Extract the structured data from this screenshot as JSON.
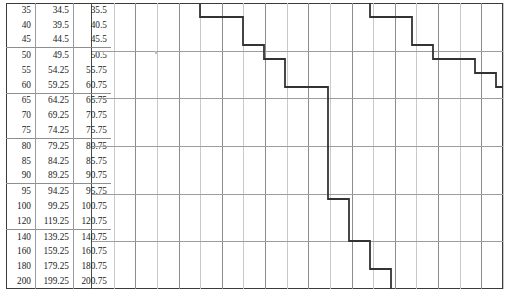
{
  "document": {
    "kind": "printed-table-with-step-chart",
    "page_background": "#ffffff",
    "frame_color": "#3b3b3b",
    "grid_line_color": "#8d8d8d",
    "grid_line_light_color": "#c9c9c9",
    "step_line_color": "#333333"
  },
  "table": {
    "name": "nominal-lower-upper-limits",
    "column_count": 3,
    "row_count": 21,
    "group_size": 3,
    "columns": [
      {
        "key": "nominal",
        "align": "right"
      },
      {
        "key": "lower",
        "align": "right"
      },
      {
        "key": "upper",
        "align": "right"
      }
    ],
    "rows": [
      {
        "nominal": "35",
        "lower": "34.5",
        "upper": "35.5",
        "group_start": true
      },
      {
        "nominal": "40",
        "lower": "39.5",
        "upper": "40.5",
        "group_start": false
      },
      {
        "nominal": "45",
        "lower": "44.5",
        "upper": "45.5",
        "group_start": false
      },
      {
        "nominal": "50",
        "lower": "49.5",
        "upper": "50.5",
        "group_start": true
      },
      {
        "nominal": "55",
        "lower": "54.25",
        "upper": "55.75",
        "group_start": false
      },
      {
        "nominal": "60",
        "lower": "59.25",
        "upper": "60.75",
        "group_start": false
      },
      {
        "nominal": "65",
        "lower": "64.25",
        "upper": "65.75",
        "group_start": true
      },
      {
        "nominal": "70",
        "lower": "69.25",
        "upper": "70.75",
        "group_start": false
      },
      {
        "nominal": "75",
        "lower": "74.25",
        "upper": "75.75",
        "group_start": false
      },
      {
        "nominal": "80",
        "lower": "79.25",
        "upper": "80.75",
        "group_start": true
      },
      {
        "nominal": "85",
        "lower": "84.25",
        "upper": "85.75",
        "group_start": false
      },
      {
        "nominal": "90",
        "lower": "89.25",
        "upper": "90.75",
        "group_start": false
      },
      {
        "nominal": "95",
        "lower": "94.25",
        "upper": "95.75",
        "group_start": true
      },
      {
        "nominal": "100",
        "lower": "99.25",
        "upper": "100.75",
        "group_start": false
      },
      {
        "nominal": "120",
        "lower": "119.25",
        "upper": "120.75",
        "group_start": false
      },
      {
        "nominal": "140",
        "lower": "139.25",
        "upper": "140.75",
        "group_start": true
      },
      {
        "nominal": "160",
        "lower": "159.25",
        "upper": "160.75",
        "group_start": false
      },
      {
        "nominal": "180",
        "lower": "179.25",
        "upper": "180.75",
        "group_start": false
      },
      {
        "nominal": "200",
        "lower": "199.25",
        "upper": "200.75",
        "group_start": false
      }
    ]
  },
  "chart_data": {
    "type": "line",
    "subtype": "step",
    "title": "",
    "xlabel": "",
    "ylabel": "",
    "grid": true,
    "legend": "none",
    "x_gridline_count": 19,
    "y_gridline_count": 7,
    "y_categories": [
      "35",
      "40",
      "45",
      "50",
      "55",
      "60",
      "65",
      "70",
      "75",
      "80",
      "85",
      "90",
      "95",
      "100",
      "120",
      "140",
      "160",
      "180",
      "200"
    ],
    "step_points": [
      {
        "x": 108,
        "y": 0
      },
      {
        "x": 108,
        "y": 14
      },
      {
        "x": 151,
        "y": 14
      },
      {
        "x": 151,
        "y": 42
      },
      {
        "x": 172,
        "y": 42
      },
      {
        "x": 172,
        "y": 56
      },
      {
        "x": 193,
        "y": 56
      },
      {
        "x": 193,
        "y": 84
      },
      {
        "x": 236,
        "y": 84
      },
      {
        "x": 236,
        "y": 196
      },
      {
        "x": 257,
        "y": 196
      },
      {
        "x": 257,
        "y": 238
      },
      {
        "x": 278,
        "y": 238
      },
      {
        "x": 278,
        "y": 266
      },
      {
        "x": 299,
        "y": 266
      },
      {
        "x": 299,
        "y": 286
      }
    ],
    "step_points_second": [
      {
        "x": 278,
        "y": 0
      },
      {
        "x": 278,
        "y": 14
      },
      {
        "x": 320,
        "y": 14
      },
      {
        "x": 320,
        "y": 42
      },
      {
        "x": 341,
        "y": 42
      },
      {
        "x": 341,
        "y": 56
      },
      {
        "x": 383,
        "y": 56
      },
      {
        "x": 383,
        "y": 70
      },
      {
        "x": 404,
        "y": 70
      },
      {
        "x": 404,
        "y": 84
      },
      {
        "x": 411,
        "y": 84
      }
    ]
  }
}
